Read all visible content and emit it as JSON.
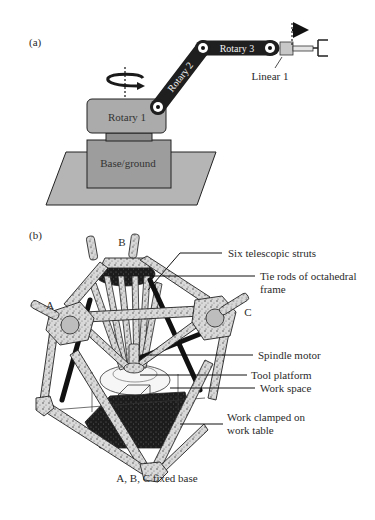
{
  "figure": {
    "panel_a": {
      "label": "(a)",
      "parts": {
        "ground": "Base/ground",
        "rotary1": "Rotary 1",
        "rotary2": "Rotary 2",
        "rotary3": "Rotary 3",
        "linear1": "Linear 1"
      },
      "colors": {
        "ground_plate": "#b5b5b5",
        "base_box": "#9d9d9d",
        "rotary1_box": "#ababab",
        "links": "#1f1f1f",
        "linear_block": "#c8c8c8"
      }
    },
    "panel_b": {
      "label": "(b)",
      "vertex_labels": {
        "a": "A",
        "b": "B",
        "c": "C"
      },
      "callouts": {
        "struts": "Six telescopic struts",
        "tie_rods_1": "Tie rods of octahedral",
        "tie_rods_2": "frame",
        "spindle": "Spindle motor",
        "tool_platform": "Tool platform",
        "work_space": "Work space",
        "work_clamped_1": "Work clamped on",
        "work_clamped_2": "work table"
      },
      "caption": "A, B, C fixed base"
    }
  }
}
